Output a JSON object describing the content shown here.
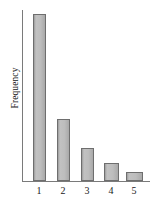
{
  "chart_data": {
    "type": "bar",
    "title": "",
    "subtitle": "",
    "xlabel": "",
    "ylabel": "Frequency",
    "categories": [
      "1",
      "2",
      "3",
      "4",
      "5"
    ],
    "values": [
      167,
      62,
      33,
      18,
      9
    ],
    "ylim": [
      0,
      171
    ],
    "xlim": [
      0,
      128
    ],
    "grid": false,
    "legend": null,
    "annotations": [],
    "axis_ticks": {
      "y_tick_labels": [],
      "x_tick_labels": [
        "1",
        "2",
        "3",
        "4",
        "5"
      ]
    },
    "style": {
      "bar_fill": "#b6b6b6",
      "bar_edge": "#6e6e6e",
      "axis_color": "#7a7a7a",
      "text_color": "#1a1a1a",
      "background": "#ffffff"
    }
  },
  "axis": {
    "y_title": "Frequency"
  },
  "bars": [
    {
      "label": "1",
      "value": 167,
      "center_x": 39,
      "width": 13
    },
    {
      "label": "2",
      "value": 62,
      "center_x": 63,
      "width": 13
    },
    {
      "label": "3",
      "value": 33,
      "center_x": 87,
      "width": 13
    },
    {
      "label": "4",
      "value": 18,
      "center_x": 111,
      "width": 15
    },
    {
      "label": "5",
      "value": 9,
      "center_x": 134,
      "width": 17
    }
  ]
}
